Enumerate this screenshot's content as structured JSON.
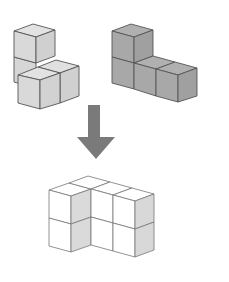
{
  "diagram": {
    "pieces": [
      {
        "id": "piece-a",
        "label": "",
        "cube_count": 4,
        "color": "#d9d9d9"
      },
      {
        "id": "piece-b",
        "label": "",
        "cube_count": 4,
        "color": "#a9a9a9"
      }
    ],
    "arrow": {
      "direction": "down",
      "color": "#7a7a7a"
    },
    "result": {
      "id": "combined-shape",
      "label": "",
      "face_color": "#ffffff",
      "shade_color": "#d8d8d8"
    }
  },
  "colors": {
    "background": "#ffffff",
    "edge": "#555555",
    "light_piece": "#d9d9d9",
    "dark_piece": "#a9a9a9",
    "arrow": "#7a7a7a"
  }
}
